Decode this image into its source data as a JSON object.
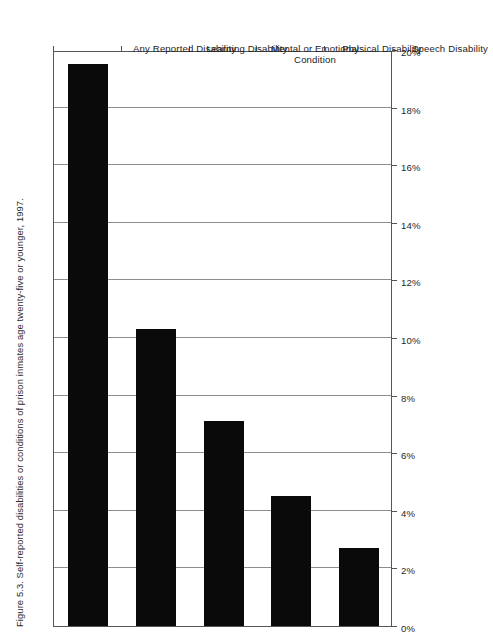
{
  "figure": {
    "title": "Figure 5.3. Self-reported disabilities or conditions of prison inmates age twenty-five or younger, 1997."
  },
  "chart_data": {
    "type": "bar",
    "orientation": "horizontal",
    "title": "Figure 5.3. Self-reported disabilities or conditions of prison inmates age twenty-five or younger, 1997.",
    "categories": [
      "Any Reported Disability",
      "Learning Disability",
      "Mental or Emotional Condition",
      "Physical Disability",
      "Speech Disability"
    ],
    "values": [
      19.5,
      10.3,
      7.1,
      4.5,
      2.7
    ],
    "value_labels": [
      "19.5%",
      "10.3%",
      "7.1%",
      "4.5%",
      "2.7%"
    ],
    "xlabel": "",
    "ylabel": "",
    "xlim": [
      0,
      20
    ],
    "tick_labels": [
      "0%",
      "2%",
      "4%",
      "6%",
      "8%",
      "10%",
      "12%",
      "14%",
      "16%",
      "18%",
      "20%"
    ],
    "tick_values": [
      0,
      2,
      4,
      6,
      8,
      10,
      12,
      14,
      16,
      18,
      20
    ],
    "grid": true,
    "legend": null,
    "bar_color": "#0a0a0a",
    "grid_color": "#8d8d8d",
    "frame_color": "#555555",
    "background": "#ffffff"
  }
}
